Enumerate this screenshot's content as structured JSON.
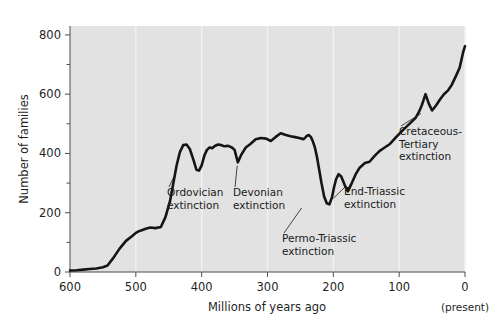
{
  "figure": {
    "background_color": "#ffffff",
    "plot_background_color": "#e2e2e2",
    "gridline_color": "#f2f2f2",
    "curve_color": "#151515",
    "axis_color": "#4d4d4d",
    "present_note": "(present)"
  },
  "chart_data": {
    "type": "line",
    "title": "",
    "xlabel": "Millions of years ago",
    "ylabel": "Number of families",
    "xlim": [
      600,
      0
    ],
    "ylim": [
      0,
      830
    ],
    "x_reversed": true,
    "grid": true,
    "grid_orientation": "vertical",
    "legend": null,
    "xticks": [
      600,
      500,
      400,
      300,
      200,
      100,
      0
    ],
    "xtick_labels": [
      "600",
      "500",
      "400",
      "300",
      "200",
      "100",
      "0"
    ],
    "yticks": [
      0,
      200,
      400,
      600,
      800
    ],
    "ytick_labels": [
      "0",
      "200",
      "400",
      "600",
      "800"
    ],
    "y_minor_ticks": [
      100,
      300,
      500,
      700
    ],
    "series": [
      {
        "name": "Number of marine families",
        "x": [
          600,
          590,
          580,
          570,
          560,
          550,
          543,
          535,
          525,
          515,
          505,
          500,
          495,
          490,
          485,
          478,
          470,
          462,
          455,
          448,
          443,
          438,
          433,
          428,
          423,
          418,
          412,
          408,
          404,
          400,
          396,
          392,
          388,
          384,
          380,
          375,
          370,
          367,
          364,
          361,
          358,
          354,
          350,
          345,
          340,
          333,
          326,
          318,
          310,
          302,
          295,
          288,
          280,
          272,
          265,
          258,
          252,
          248,
          245,
          242,
          240,
          237,
          234,
          231,
          228,
          225,
          222,
          218,
          214,
          210,
          206,
          202,
          199,
          196,
          192,
          188,
          183,
          178,
          172,
          166,
          160,
          152,
          145,
          138,
          130,
          122,
          114,
          106,
          98,
          90,
          82,
          75,
          70,
          66,
          63,
          60,
          55,
          50,
          44,
          38,
          32,
          26,
          20,
          14,
          8,
          3,
          0
        ],
        "y": [
          5,
          6,
          8,
          10,
          12,
          16,
          22,
          45,
          78,
          105,
          122,
          132,
          138,
          142,
          146,
          150,
          148,
          152,
          185,
          240,
          300,
          360,
          405,
          428,
          430,
          415,
          375,
          345,
          342,
          360,
          392,
          412,
          420,
          418,
          425,
          430,
          428,
          425,
          424,
          426,
          424,
          420,
          412,
          370,
          395,
          420,
          432,
          448,
          452,
          450,
          442,
          455,
          468,
          462,
          458,
          455,
          452,
          450,
          448,
          455,
          460,
          462,
          455,
          440,
          420,
          390,
          352,
          300,
          255,
          232,
          228,
          252,
          285,
          312,
          330,
          322,
          295,
          272,
          300,
          330,
          352,
          368,
          372,
          390,
          408,
          420,
          432,
          452,
          470,
          488,
          505,
          520,
          540,
          560,
          580,
          600,
          568,
          545,
          562,
          582,
          600,
          612,
          632,
          660,
          690,
          740,
          762
        ]
      }
    ],
    "annotations": [
      {
        "id": "ordovician",
        "label_lines": [
          "Ordovician",
          "extinction"
        ],
        "event_x": 440,
        "event_y": 345,
        "label_x_px": 167,
        "label_y_px": 196
      },
      {
        "id": "devonian",
        "label_lines": [
          "Devonian",
          "extinction"
        ],
        "event_x": 346,
        "event_y": 372,
        "label_x_px": 233,
        "label_y_px": 196
      },
      {
        "id": "permo-triassic",
        "label_lines": [
          "Permo-Triassic",
          "extinction"
        ],
        "event_x": 248,
        "event_y": 230,
        "label_x_px": 282,
        "label_y_px": 242
      },
      {
        "id": "end-triassic",
        "label_lines": [
          "End-Triassic",
          "extinction"
        ],
        "event_x": 200,
        "event_y": 262,
        "label_x_px": 344,
        "label_y_px": 195
      },
      {
        "id": "cretaceous-tertiary",
        "label_lines": [
          "Cretaceous-",
          "Tertiary",
          "extinction"
        ],
        "event_x": 67,
        "event_y": 548,
        "label_x_px": 399,
        "label_y_px": 135
      }
    ]
  }
}
